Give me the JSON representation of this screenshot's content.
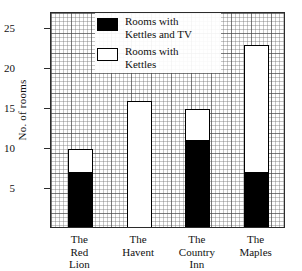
{
  "chart_data": {
    "type": "bar",
    "stacked": true,
    "title": "",
    "xlabel": "",
    "ylabel": "No. of rooms",
    "ylim": [
      0,
      27
    ],
    "yticks": [
      5,
      10,
      15,
      20,
      25
    ],
    "grid": "fine graph paper grid, major lines every 5 minor cells",
    "legend_position": "top-center-inside",
    "categories": [
      "The\nRed\nLion",
      "The\nHavent",
      "The\nCountry\nInn",
      "The\nMaples"
    ],
    "categories_flat": [
      "The Red Lion",
      "The Havent",
      "The Country Inn",
      "The Maples"
    ],
    "series": [
      {
        "name": "Rooms with Kettles and TV",
        "fill": "#000000",
        "values": [
          7,
          0,
          11,
          7
        ]
      },
      {
        "name": "Rooms with Kettles",
        "fill": "#ffffff",
        "values": [
          3,
          16,
          4,
          16
        ]
      }
    ],
    "bar_totals": [
      10,
      16,
      15,
      23
    ]
  },
  "axes": {
    "y_title": "No. of rooms",
    "y_ticks": [
      {
        "label": "25",
        "value": 25
      },
      {
        "label": "20",
        "value": 20
      },
      {
        "label": "15",
        "value": 15
      },
      {
        "label": "10",
        "value": 10
      },
      {
        "label": "5",
        "value": 5
      }
    ]
  },
  "legend": {
    "items": [
      {
        "label": "Rooms with\nKettles and TV",
        "swatch": "filled"
      },
      {
        "label": "Rooms with\nKettles",
        "swatch": "hollow"
      }
    ]
  },
  "bars": [
    {
      "name": "The Red Lion",
      "label": "The\nRed\nLion",
      "total": 10,
      "kettles_and_tv": 7,
      "kettles_only": 3
    },
    {
      "name": "The Havent",
      "label": "The\nHavent",
      "total": 16,
      "kettles_and_tv": 0,
      "kettles_only": 16
    },
    {
      "name": "The Country Inn",
      "label": "The\nCountry\nInn",
      "total": 15,
      "kettles_and_tv": 11,
      "kettles_only": 4
    },
    {
      "name": "The Maples",
      "label": "The\nMaples",
      "total": 23,
      "kettles_and_tv": 7,
      "kettles_only": 16
    }
  ],
  "colors": {
    "kettles_and_tv": "#000000",
    "kettles": "#ffffff",
    "outline": "#000000",
    "grid_major": "#3c3c3c",
    "grid_minor": "#787878"
  }
}
